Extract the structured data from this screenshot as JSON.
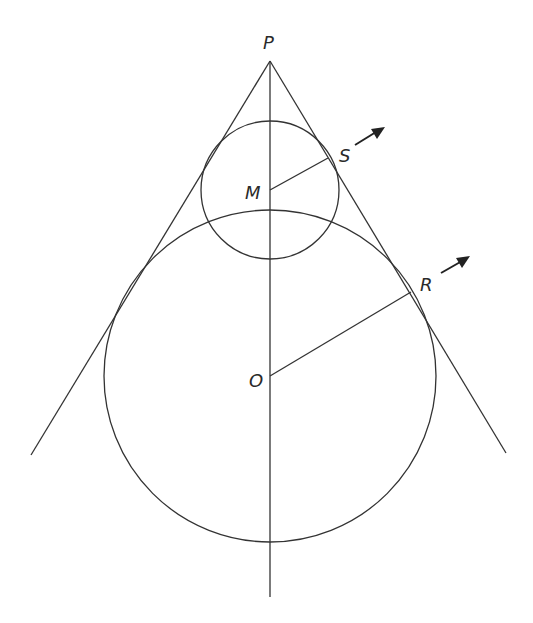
{
  "figure": {
    "type": "geometry-diagram",
    "labels": {
      "P": "P",
      "M": "M",
      "S": "S",
      "O": "O",
      "R": "R"
    },
    "points": {
      "P": {
        "x": 270,
        "y": 61
      },
      "M": {
        "x": 270,
        "y": 190
      },
      "S": {
        "x": 328,
        "y": 158
      },
      "O": {
        "x": 270,
        "y": 376
      },
      "R": {
        "x": 411,
        "y": 292
      }
    },
    "circles": [
      {
        "name": "small-circle",
        "center": "M",
        "radius": 69
      },
      {
        "name": "large-circle",
        "center": "O",
        "radius": 166
      }
    ],
    "lines": [
      {
        "name": "left-tangent-line",
        "from": {
          "x": 270,
          "y": 61
        },
        "to": {
          "x": 31,
          "y": 455
        }
      },
      {
        "name": "right-tangent-line",
        "from": {
          "x": 270,
          "y": 61
        },
        "to": {
          "x": 506,
          "y": 453
        }
      },
      {
        "name": "axis-line",
        "from": {
          "x": 270,
          "y": 61
        },
        "to": {
          "x": 270,
          "y": 597
        }
      },
      {
        "name": "radius-MS",
        "from": "M",
        "to": "S"
      },
      {
        "name": "radius-OR",
        "from": "O",
        "to": "R"
      }
    ],
    "arrows": [
      {
        "name": "arrow-at-S",
        "from": {
          "x": 355,
          "y": 145
        },
        "to": {
          "x": 383,
          "y": 128
        }
      },
      {
        "name": "arrow-at-R",
        "from": {
          "x": 441,
          "y": 273
        },
        "to": {
          "x": 468,
          "y": 257
        }
      }
    ],
    "colors": {
      "stroke": "#333333",
      "background": "#ffffff"
    }
  }
}
